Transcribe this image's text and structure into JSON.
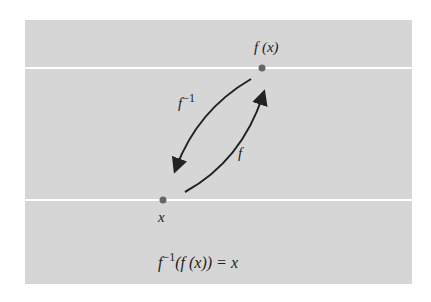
{
  "diagram": {
    "points": {
      "x": {
        "label": "x"
      },
      "fx": {
        "label": "f (x)"
      }
    },
    "arrows": {
      "forward": {
        "label": "f"
      },
      "inverse": {
        "label_base": "f",
        "label_sup": "−1"
      }
    },
    "equation": {
      "f": "f",
      "sup": "−1",
      "rest": "(f (x)) = x"
    },
    "colors": {
      "background": "#d6d6d6",
      "lines": "#ffffff",
      "ink": "#222222",
      "dot": "#666666"
    }
  }
}
